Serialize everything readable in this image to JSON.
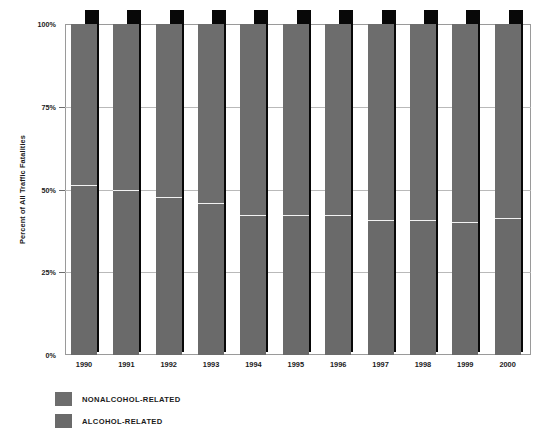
{
  "chart_data": {
    "type": "bar",
    "subtype": "stacked-percentage",
    "title": "",
    "xlabel": "",
    "ylabel": "Percent of All Traffic Fatalities",
    "ylim": [
      0,
      100
    ],
    "ytick_labels": [
      "100%",
      "75%",
      "50%",
      "25%",
      "0%"
    ],
    "ytick_values": [
      100,
      75,
      50,
      25,
      0
    ],
    "grid": true,
    "legend_position": "bottom-left",
    "categories": [
      "1990",
      "1991",
      "1992",
      "1993",
      "1994",
      "1995",
      "1996",
      "1997",
      "1998",
      "1999",
      "2000"
    ],
    "series": [
      {
        "name": "NONALCOHOL-RELATED",
        "color": "#6d6d6d",
        "values": [
          49,
          50.5,
          52.5,
          54.5,
          58,
          58,
          58,
          59.5,
          59.5,
          60,
          59
        ]
      },
      {
        "name": "ALCOHOL-RELATED",
        "color": "#6a6a6a",
        "values": [
          51,
          49.5,
          47.5,
          45.5,
          42,
          42,
          42,
          40.5,
          40.5,
          40,
          41
        ]
      }
    ]
  },
  "legend": {
    "items": [
      {
        "label": "NONALCOHOL-RELATED",
        "color": "#6d6d6d"
      },
      {
        "label": "ALCOHOL-RELATED",
        "color": "#6a6a6a"
      }
    ]
  },
  "axes": {
    "y_title": "Percent of All Traffic Fatalities"
  },
  "colors": {
    "bar_front": "#6d6d6d",
    "bar_shadow": "#080808",
    "divider": "#f2f2f2",
    "grid": "#b9b9b9",
    "frame": "#9a9a9a",
    "background": "#ffffff",
    "text": "#1b1b1b"
  }
}
